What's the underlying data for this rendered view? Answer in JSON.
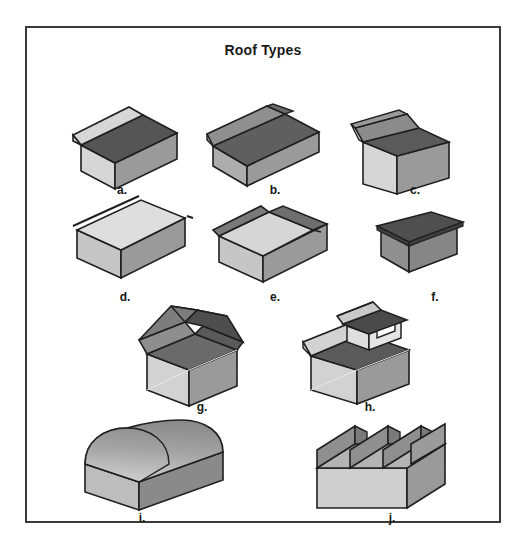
{
  "plate": {
    "title": "Roof Types",
    "border_color": "#3a3a3a",
    "background": "#ffffff"
  },
  "palette": {
    "dark": "#555555",
    "dark_alt": "#5f5f5f",
    "medium": "#9a9a9a",
    "medium_light": "#adadad",
    "light": "#d6d6d6",
    "lighter": "#e2e2e2",
    "outline": "#1f1f1f"
  },
  "figures": [
    {
      "key": "a",
      "label": "a.",
      "name": "gable-roof"
    },
    {
      "key": "b",
      "label": "b.",
      "name": "hip-roof"
    },
    {
      "key": "c",
      "label": "c.",
      "name": "gambrel-roof"
    },
    {
      "key": "d",
      "label": "d.",
      "name": "flat-roof"
    },
    {
      "key": "e",
      "label": "e.",
      "name": "butterfly-roof"
    },
    {
      "key": "f",
      "label": "f.",
      "name": "shed-roof"
    },
    {
      "key": "g",
      "label": "g.",
      "name": "mansard-roof"
    },
    {
      "key": "h",
      "label": "h.",
      "name": "monitor-roof"
    },
    {
      "key": "i",
      "label": "i.",
      "name": "barrel-vault-roof"
    },
    {
      "key": "j",
      "label": "j.",
      "name": "sawtooth-roof"
    }
  ]
}
